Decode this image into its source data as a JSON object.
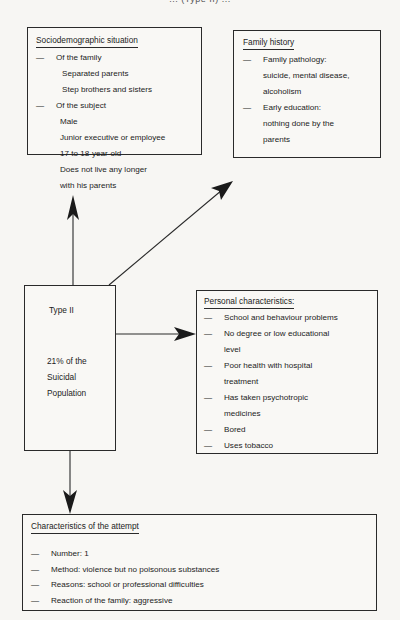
{
  "page": {
    "header_fragment": "... (Type II) ..."
  },
  "diagram": {
    "center": {
      "type_label": "Type II",
      "percentage_lines": [
        "21% of the",
        "Suicidal",
        "Population"
      ]
    },
    "sociodemographic": {
      "title": "Sociodemographic situation",
      "groups": [
        {
          "heading": "Of the family",
          "items": [
            "Separated parents",
            "Step brothers and sisters"
          ]
        },
        {
          "heading": "Of the subject",
          "items": [
            "Male",
            "Junior executive or employee",
            "17 to 18-year-old",
            "Does not live any longer",
            "with his parents"
          ]
        }
      ]
    },
    "family_history": {
      "title": "Family history",
      "items": [
        {
          "lines": [
            "Family pathology:",
            "suicide, mental disease,",
            "alcoholism"
          ]
        },
        {
          "lines": [
            "Early education:",
            "nothing done by the",
            "parents"
          ]
        }
      ]
    },
    "personal_characteristics": {
      "title": "Personal characteristics:",
      "items": [
        {
          "lines": [
            "School and behaviour problems"
          ]
        },
        {
          "lines": [
            "No degree or low educational",
            "level"
          ]
        },
        {
          "lines": [
            "Poor health with hospital",
            "treatment"
          ]
        },
        {
          "lines": [
            "Has taken psychotropic",
            "medicines"
          ]
        },
        {
          "lines": [
            "Bored"
          ]
        },
        {
          "lines": [
            "Uses tobacco"
          ]
        }
      ]
    },
    "attempt": {
      "title": "Characteristics of the attempt",
      "items": [
        "Number: 1",
        "Method: violence but no poisonous substances",
        "Reasons: school or professional difficulties",
        "Reaction of the family: aggressive"
      ]
    },
    "dash_glyph": "—",
    "line_color": "#2a2a2a"
  }
}
